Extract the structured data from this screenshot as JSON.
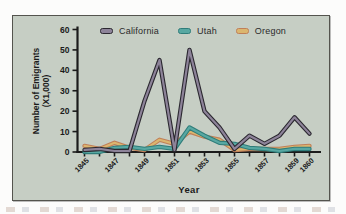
{
  "figure": {
    "y_axis_label_line1": "Number of Emigrants",
    "y_axis_label_line2": "(X1,000)",
    "x_axis_label": "Year"
  },
  "colors": {
    "page_bg": "#fcfcfb",
    "frame_bg": "#c6cec4",
    "frame_border": "#54544e",
    "axis": "#1b1b1b",
    "legend_text": "#2a2a2a"
  },
  "chart_data": {
    "type": "line",
    "title": "",
    "xlabel": "Year",
    "ylabel": "Number of Emigrants (X1,000)",
    "x": [
      1845,
      1846,
      1847,
      1848,
      1849,
      1850,
      1851,
      1852,
      1853,
      1854,
      1855,
      1856,
      1857,
      1858,
      1859,
      1860
    ],
    "x_tick_labels": [
      "1845",
      "1847",
      "1849",
      "1851",
      "1853",
      "1855",
      "1857",
      "1859",
      "1860"
    ],
    "y_ticks": [
      0,
      10,
      20,
      30,
      40,
      50,
      60
    ],
    "ylim": [
      0,
      60
    ],
    "grid": false,
    "legend_position": "top",
    "series": [
      {
        "name": "California",
        "color": "#8d8399",
        "outline_color": "#2b2830",
        "values": [
          1,
          1.5,
          0.5,
          0.5,
          25,
          45,
          1,
          50,
          20,
          12,
          1.5,
          8,
          4,
          8,
          17,
          9
        ]
      },
      {
        "name": "Utah",
        "color": "#58a8a2",
        "outline_color": "#2f7d7a",
        "values": [
          0,
          0,
          2,
          2.5,
          1.5,
          2.5,
          1.5,
          12,
          8,
          4.5,
          4,
          2,
          1.5,
          0.5,
          1.5,
          1.5
        ]
      },
      {
        "name": "Oregon",
        "color": "#dbb66f",
        "outline_color": "#c07f58",
        "values": [
          3,
          1.5,
          4.5,
          2,
          1,
          6,
          4,
          10,
          7.5,
          6,
          1,
          1.5,
          1.5,
          1.5,
          2.5,
          3
        ]
      }
    ]
  }
}
